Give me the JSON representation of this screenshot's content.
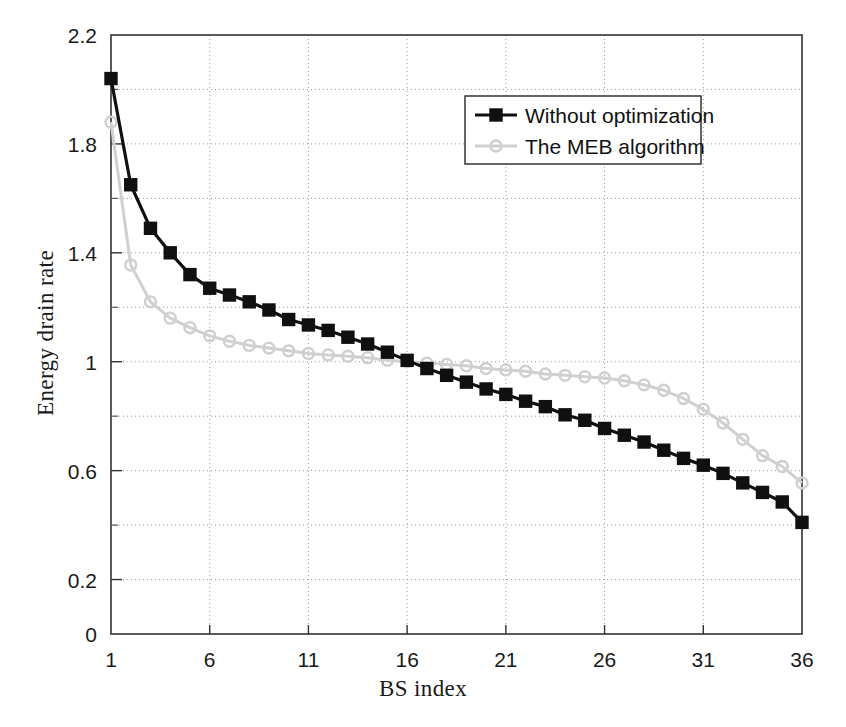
{
  "chart_data": {
    "type": "line",
    "title": "",
    "xlabel": "BS index",
    "ylabel": "Energy drain rate",
    "xlim": [
      1,
      36
    ],
    "ylim": [
      0,
      2.2
    ],
    "xticks": [
      1,
      6,
      11,
      16,
      21,
      26,
      31,
      36
    ],
    "xticklabels": [
      "1",
      "6",
      "11",
      "16",
      "21",
      "26",
      "31",
      "36"
    ],
    "yticks": [
      0,
      0.2,
      0.6,
      1,
      1.4,
      1.8,
      2.2
    ],
    "yticklabels": [
      "0",
      "0.2",
      "0.6",
      "1",
      "1.4",
      "1.8",
      "2.2"
    ],
    "y_minor_ticks": [
      0.4,
      0.8,
      1.2,
      1.6,
      2.0
    ],
    "grid": true,
    "grid_style": "dotted",
    "legend_position": "upper right",
    "x": [
      1,
      2,
      3,
      4,
      5,
      6,
      7,
      8,
      9,
      10,
      11,
      12,
      13,
      14,
      15,
      16,
      17,
      18,
      19,
      20,
      21,
      22,
      23,
      24,
      25,
      26,
      27,
      28,
      29,
      30,
      31,
      32,
      33,
      34,
      35,
      36
    ],
    "series": [
      {
        "name": "Without optimization",
        "color": "#101010",
        "marker": "square",
        "values": [
          2.04,
          1.65,
          1.49,
          1.4,
          1.32,
          1.27,
          1.245,
          1.22,
          1.19,
          1.155,
          1.135,
          1.115,
          1.09,
          1.065,
          1.035,
          1.005,
          0.975,
          0.95,
          0.925,
          0.9,
          0.88,
          0.855,
          0.835,
          0.805,
          0.785,
          0.755,
          0.73,
          0.705,
          0.675,
          0.645,
          0.62,
          0.59,
          0.555,
          0.52,
          0.485,
          0.41
        ]
      },
      {
        "name": "The MEB algorithm",
        "color": "#d0d0d0",
        "marker": "circle",
        "values": [
          1.88,
          1.355,
          1.22,
          1.16,
          1.125,
          1.095,
          1.075,
          1.06,
          1.05,
          1.04,
          1.03,
          1.025,
          1.02,
          1.015,
          1.005,
          1.0,
          0.995,
          0.99,
          0.985,
          0.975,
          0.97,
          0.965,
          0.955,
          0.95,
          0.945,
          0.94,
          0.93,
          0.915,
          0.895,
          0.865,
          0.825,
          0.775,
          0.715,
          0.655,
          0.615,
          0.555
        ]
      }
    ]
  },
  "legend": {
    "entries": [
      {
        "label": "Without optimization"
      },
      {
        "label": "The MEB algorithm"
      }
    ]
  }
}
